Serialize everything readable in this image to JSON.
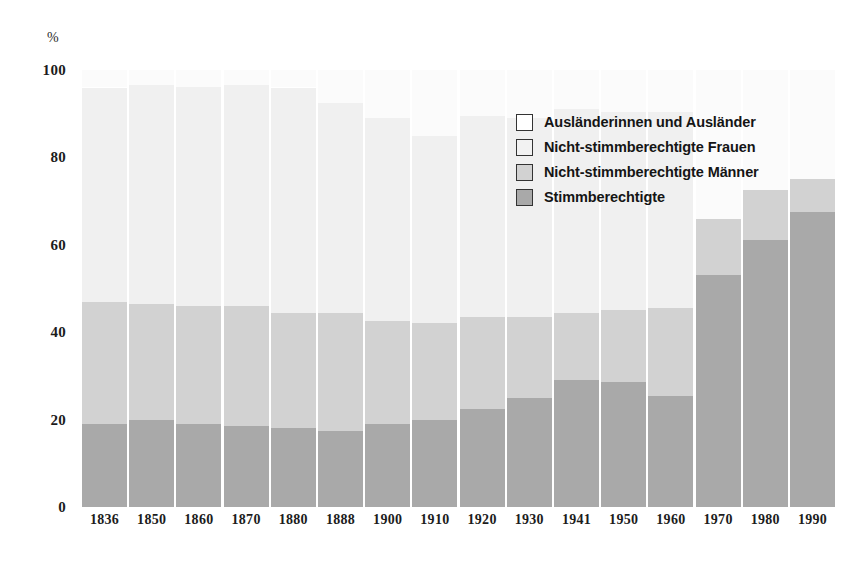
{
  "chart_data": {
    "type": "bar",
    "subtype": "stacked-bar-percent",
    "title": "",
    "subtitle": "",
    "xlabel": "",
    "ylabel": "%",
    "ylim": [
      0,
      100
    ],
    "yticks": [
      0,
      20,
      40,
      60,
      80,
      100
    ],
    "ytick_labels": [
      "0",
      "20",
      "40",
      "60",
      "80",
      "100"
    ],
    "grid": false,
    "legend_position": "inside-top-right",
    "categories": [
      "1836",
      "1850",
      "1860",
      "1870",
      "1880",
      "1888",
      "1900",
      "1910",
      "1920",
      "1930",
      "1941",
      "1950",
      "1960",
      "1970",
      "1980",
      "1990"
    ],
    "series": [
      {
        "name": "Stimmberechtigte",
        "color": "#a9a9a9",
        "values": [
          19,
          20,
          19,
          18.5,
          18,
          17.5,
          19,
          20,
          22.5,
          25,
          29,
          28.5,
          25.5,
          53,
          61,
          67.5
        ]
      },
      {
        "name": "Nicht-stimmberechtigte Männer",
        "color": "#d2d2d2",
        "values": [
          28,
          26.5,
          27,
          27.5,
          26.5,
          27,
          23.5,
          22,
          21,
          18.5,
          15.5,
          16.5,
          20,
          13,
          11.5,
          7.5
        ]
      },
      {
        "name": "Nicht-stimmberechtigte Frauen",
        "color": "#f0f0f0",
        "values": [
          49,
          50,
          50,
          50.5,
          51.5,
          48,
          46.5,
          43,
          46,
          45.5,
          46.5,
          45.5,
          45,
          0,
          0,
          0
        ]
      },
      {
        "name": "Ausländerinnen und Ausländer",
        "color": "#fbfbfb",
        "values": [
          4,
          3.5,
          4,
          3.5,
          4,
          7.5,
          11,
          15,
          10.5,
          11,
          9,
          9.5,
          9.5,
          34,
          27.5,
          25
        ]
      }
    ],
    "cumulative_tops": [
      {
        "category": "1836",
        "stimm": 19,
        "maenner": 47,
        "frauen": 96,
        "auslaender": 100
      },
      {
        "category": "1850",
        "stimm": 20,
        "maenner": 46.5,
        "frauen": 96.5,
        "auslaender": 100
      },
      {
        "category": "1860",
        "stimm": 19,
        "maenner": 46,
        "frauen": 96,
        "auslaender": 100
      },
      {
        "category": "1870",
        "stimm": 18.5,
        "maenner": 46,
        "frauen": 96.5,
        "auslaender": 100
      },
      {
        "category": "1880",
        "stimm": 18,
        "maenner": 44.5,
        "frauen": 96,
        "auslaender": 100
      },
      {
        "category": "1888",
        "stimm": 17.5,
        "maenner": 44.5,
        "frauen": 92.5,
        "auslaender": 100
      },
      {
        "category": "1900",
        "stimm": 19,
        "maenner": 42.5,
        "frauen": 89,
        "auslaender": 100
      },
      {
        "category": "1910",
        "stimm": 20,
        "maenner": 42,
        "frauen": 85,
        "auslaender": 100
      },
      {
        "category": "1920",
        "stimm": 22.5,
        "maenner": 43.5,
        "frauen": 89.5,
        "auslaender": 100
      },
      {
        "category": "1930",
        "stimm": 25,
        "maenner": 43.5,
        "frauen": 89,
        "auslaender": 100
      },
      {
        "category": "1941",
        "stimm": 29,
        "maenner": 44.5,
        "frauen": 91,
        "auslaender": 100
      },
      {
        "category": "1950",
        "stimm": 28.5,
        "maenner": 45,
        "frauen": 90.5,
        "auslaender": 100
      },
      {
        "category": "1960",
        "stimm": 25.5,
        "maenner": 45.5,
        "frauen": 90.5,
        "auslaender": 100
      },
      {
        "category": "1970",
        "stimm": 53,
        "maenner": 66,
        "frauen": 66,
        "auslaender": 100
      },
      {
        "category": "1980",
        "stimm": 61,
        "maenner": 72.5,
        "frauen": 72.5,
        "auslaender": 100
      },
      {
        "category": "1990",
        "stimm": 67.5,
        "maenner": 75,
        "frauen": 75,
        "auslaender": 100
      }
    ]
  },
  "axis": {
    "unit": "%",
    "y_ticks": [
      "100",
      "80",
      "60",
      "40",
      "20",
      "0"
    ],
    "y_tick_values": [
      100,
      80,
      60,
      40,
      20,
      0
    ],
    "x_labels": [
      "1836",
      "1850",
      "1860",
      "1870",
      "1880",
      "1888",
      "1900",
      "1910",
      "1920",
      "1930",
      "1941",
      "1950",
      "1960",
      "1970",
      "1980",
      "1990"
    ]
  },
  "legend": {
    "items": [
      {
        "label": "Ausländerinnen und Ausländer",
        "color": "#ffffff"
      },
      {
        "label": "Nicht-stimmberechtigte Frauen",
        "color": "#f2f2f2"
      },
      {
        "label": "Nicht-stimmberechtigte Männer",
        "color": "#d2d2d2"
      },
      {
        "label": "Stimmberechtigte",
        "color": "#a9a9a9"
      }
    ]
  }
}
